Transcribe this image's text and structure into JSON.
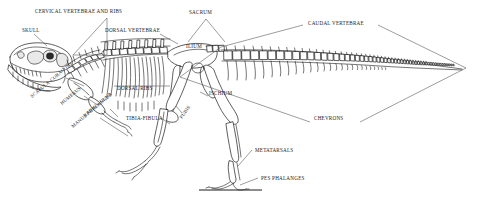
{
  "figure": {
    "orientation": "facing-left",
    "background_color": "#ffffff",
    "line_color": "#1a1a1a",
    "leader_color": "#5a5a5a",
    "width": 495,
    "height": 201
  },
  "labels": [
    {
      "id": "cervical-vertebrae-and-ribs",
      "text": "CERVICAL VERTEBRAE AND RIBS",
      "x": 35,
      "y": 13,
      "anchor": "start",
      "rotation": 0,
      "bracket": "triangle"
    },
    {
      "id": "skull",
      "text": "SKULL",
      "x": 22,
      "y": 32,
      "anchor": "start",
      "rotation": 0,
      "bracket": "leader"
    },
    {
      "id": "dorsal-vertebrae",
      "text": "DORSAL VERTEBRAE",
      "x": 105,
      "y": 32,
      "anchor": "start",
      "rotation": 0,
      "bracket": "leader"
    },
    {
      "id": "sacrum",
      "text": "SACRUM",
      "x": 189,
      "y": 14,
      "anchor": "start",
      "rotation": 0,
      "bracket": "triangle"
    },
    {
      "id": "caudal-vertebrae",
      "text": "CAUDAL VERTEBRAE",
      "x": 308,
      "y": 25,
      "anchor": "start",
      "rotation": 0,
      "bracket": "diamond"
    },
    {
      "id": "ilium",
      "text": "ILIUM",
      "x": 186,
      "y": 48,
      "anchor": "start",
      "rotation": 0,
      "bracket": "none"
    },
    {
      "id": "ischium",
      "text": "ISCHIUM",
      "x": 209,
      "y": 95,
      "anchor": "start",
      "rotation": 0,
      "bracket": "leader"
    },
    {
      "id": "chevrons",
      "text": "CHEVRONS",
      "x": 314,
      "y": 120,
      "anchor": "start",
      "rotation": 0,
      "bracket": "diamond"
    },
    {
      "id": "scapula-coracoid",
      "text": "SCAPULA-CORACOID",
      "x": 32,
      "y": 98,
      "anchor": "start",
      "rotation": -40,
      "bracket": "leader"
    },
    {
      "id": "humerus",
      "text": "HUMERUS",
      "x": 62,
      "y": 105,
      "anchor": "start",
      "rotation": -40,
      "bracket": "leader"
    },
    {
      "id": "dorsal-ribs",
      "text": "DORSAL RIBS",
      "x": 117,
      "y": 90,
      "anchor": "start",
      "rotation": 0,
      "bracket": "line"
    },
    {
      "id": "radius-ulna",
      "text": "RADIUS-ULNA",
      "x": 85,
      "y": 117,
      "anchor": "start",
      "rotation": -40,
      "bracket": "leader"
    },
    {
      "id": "manus-phalanges",
      "text": "MANUS PHALANGES",
      "x": 73,
      "y": 128,
      "anchor": "start",
      "rotation": -40,
      "bracket": "leader"
    },
    {
      "id": "tibia-fibula",
      "text": "TIBIA-FIBULA",
      "x": 126,
      "y": 120,
      "anchor": "start",
      "rotation": 0,
      "bracket": "leader"
    },
    {
      "id": "pubis",
      "text": "PUBIS",
      "x": 182,
      "y": 119,
      "anchor": "start",
      "rotation": -55,
      "bracket": "leader"
    },
    {
      "id": "metatarsals",
      "text": "METATARSALS",
      "x": 255,
      "y": 152,
      "anchor": "start",
      "rotation": 0,
      "bracket": "leader"
    },
    {
      "id": "pes-phalanges",
      "text": "PES PHALANGES",
      "x": 261,
      "y": 180,
      "anchor": "start",
      "rotation": 0,
      "bracket": "leader"
    }
  ]
}
